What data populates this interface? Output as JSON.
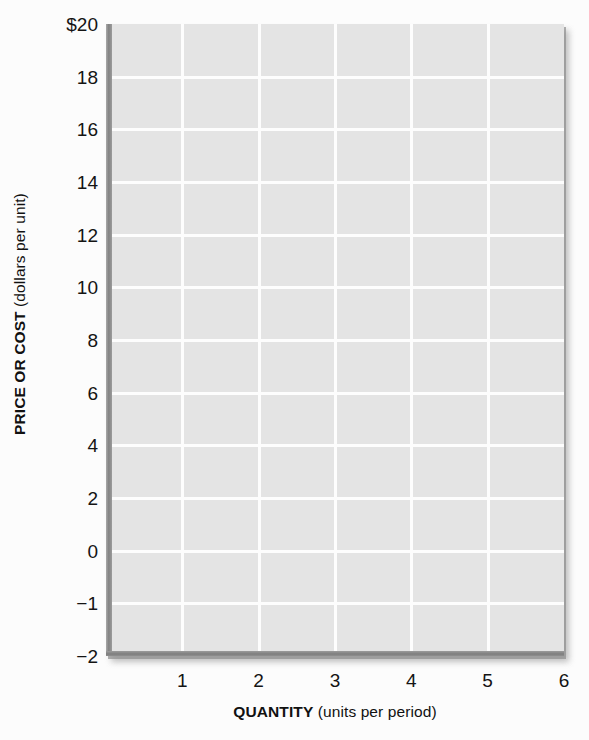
{
  "chart_data": {
    "type": "line",
    "title": "",
    "subtitle": "",
    "xlabel_strong": "QUANTITY",
    "xlabel_weak": " (units per period)",
    "ylabel_strong": "PRICE OR COST",
    "ylabel_weak": " (dollars per unit)",
    "x": [
      1,
      2,
      3,
      4,
      5,
      6
    ],
    "xtick_labels": [
      "1",
      "2",
      "3",
      "4",
      "5",
      "6"
    ],
    "ytick_labels": [
      "$20",
      "18",
      "16",
      "14",
      "12",
      "10",
      "8",
      "6",
      "4",
      "2",
      "0",
      "−1",
      "−2"
    ],
    "ytick_values": [
      20,
      18,
      16,
      14,
      12,
      10,
      8,
      6,
      4,
      2,
      0,
      -1,
      -2
    ],
    "xlim": [
      0,
      6
    ],
    "ylim": [
      -2,
      20
    ],
    "grid": true,
    "legend": "none",
    "series": [],
    "annotations": [],
    "note": "Blank graph template: gridded plot area with no plotted data series."
  },
  "figure": {
    "plot_bg_color": "#e4e4e4",
    "gridline_color": "#fdfdfd",
    "axis_color": "#828282",
    "page_bg_color": "#fcfcfc",
    "text_color": "#141414"
  }
}
